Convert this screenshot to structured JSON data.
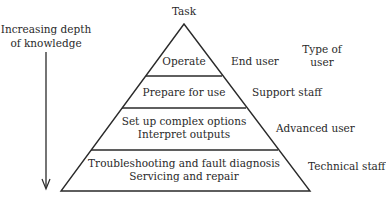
{
  "diagram": {
    "apex_label": "Task",
    "axis_label_line1": "Increasing depth",
    "axis_label_line2": "of knowledge",
    "column_header_line1": "Type of",
    "column_header_line2": "user",
    "layers": [
      {
        "task_line1": "Operate",
        "task_line2": "",
        "user": "End user"
      },
      {
        "task_line1": "Prepare for use",
        "task_line2": "",
        "user": "Support staff"
      },
      {
        "task_line1": "Set up complex options",
        "task_line2": "Interpret outputs",
        "user": "Advanced user"
      },
      {
        "task_line1": "Troubleshooting and fault diagnosis",
        "task_line2": "Servicing and repair",
        "user": "Technical staff"
      }
    ]
  }
}
